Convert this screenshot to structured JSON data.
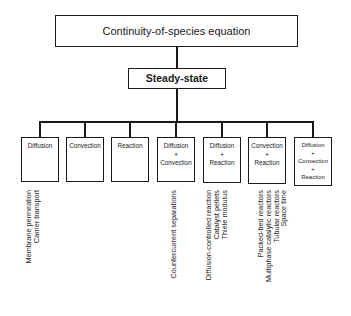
{
  "diagram": {
    "root": "Continuity-of-species equation",
    "level2": "Steady-state",
    "leaves": [
      {
        "lines": [
          "Diffusion"
        ],
        "applications": [
          "Membrane permeation",
          "Carrier transport"
        ]
      },
      {
        "lines": [
          "Convection"
        ],
        "applications": []
      },
      {
        "lines": [
          "Reaction"
        ],
        "applications": []
      },
      {
        "lines": [
          "Diffusion",
          "+",
          "Convection"
        ],
        "applications": [
          "Countercurrent separations"
        ]
      },
      {
        "lines": [
          "Diffusion",
          "+",
          "Reaction"
        ],
        "applications": [
          "Diffusion-controlled reaction",
          "Catalyst pellets",
          "Thiele modulus"
        ]
      },
      {
        "lines": [
          "Convection",
          "+",
          "Reaction"
        ],
        "applications": [
          "Packed-bed reactors",
          "Multiphase catalytic reactors",
          "Tubular reactors",
          "Space time"
        ]
      },
      {
        "lines": [
          "Diffusion",
          "+",
          "Convection",
          "+",
          "Reaction"
        ],
        "applications": []
      }
    ]
  }
}
